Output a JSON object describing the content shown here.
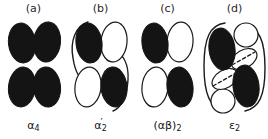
{
  "figure": {
    "background_color": "#ffffff",
    "fill_dark_color": "#141414",
    "stroke_color": "#1a1a1a",
    "panel_count": 4
  },
  "panels": [
    {
      "header": "(a)",
      "caption_base": "α",
      "caption_prime": "",
      "caption_sub": "4",
      "caption_plain": "α4",
      "name": "alpha4",
      "subunits": [
        {
          "id": "top-left",
          "shape": "ellipse",
          "fill": "dark"
        },
        {
          "id": "top-right",
          "shape": "ellipse",
          "fill": "dark"
        },
        {
          "id": "bottom-left",
          "shape": "ellipse",
          "fill": "dark"
        },
        {
          "id": "bottom-right",
          "shape": "ellipse",
          "fill": "dark"
        }
      ],
      "brackets": 0,
      "dashed_axes": 0
    },
    {
      "header": "(b)",
      "caption_base": "α",
      "caption_prime": "′",
      "caption_sub": "2",
      "caption_plain": "α′2",
      "name": "alpha-prime-2",
      "subunits": [
        {
          "id": "top-left",
          "shape": "ellipse",
          "fill": "dark"
        },
        {
          "id": "top-right",
          "shape": "ellipse",
          "fill": "open"
        },
        {
          "id": "bottom-left",
          "shape": "ellipse",
          "fill": "open"
        },
        {
          "id": "bottom-right",
          "shape": "ellipse",
          "fill": "dark"
        }
      ],
      "brackets": 2,
      "dashed_axes": 0
    },
    {
      "header": "(c)",
      "caption_base": "(αβ)",
      "caption_prime": "",
      "caption_sub": "2",
      "caption_plain": "(αβ)2",
      "name": "alpha-beta-2",
      "subunits": [
        {
          "id": "top-left",
          "shape": "ellipse",
          "fill": "dark"
        },
        {
          "id": "top-right",
          "shape": "ellipse",
          "fill": "open"
        },
        {
          "id": "bottom-left",
          "shape": "ellipse",
          "fill": "open"
        },
        {
          "id": "bottom-right",
          "shape": "ellipse",
          "fill": "dark"
        }
      ],
      "brackets": 0,
      "dashed_axes": 0
    },
    {
      "header": "(d)",
      "caption_base": "ε",
      "caption_prime": "",
      "caption_sub": "2",
      "caption_plain": "ε2",
      "name": "epsilon-2",
      "subunits": [
        {
          "id": "top-left",
          "shape": "ellipse",
          "fill": "dark"
        },
        {
          "id": "top-right-circle",
          "shape": "circle",
          "fill": "open"
        },
        {
          "id": "center-right-tilted",
          "shape": "ellipse",
          "fill": "open"
        },
        {
          "id": "center-left-tilted",
          "shape": "ellipse",
          "fill": "open"
        },
        {
          "id": "bottom-left-circle",
          "shape": "circle",
          "fill": "open"
        },
        {
          "id": "bottom-right",
          "shape": "ellipse",
          "fill": "dark"
        }
      ],
      "brackets": 2,
      "dashed_axes": 2
    }
  ]
}
